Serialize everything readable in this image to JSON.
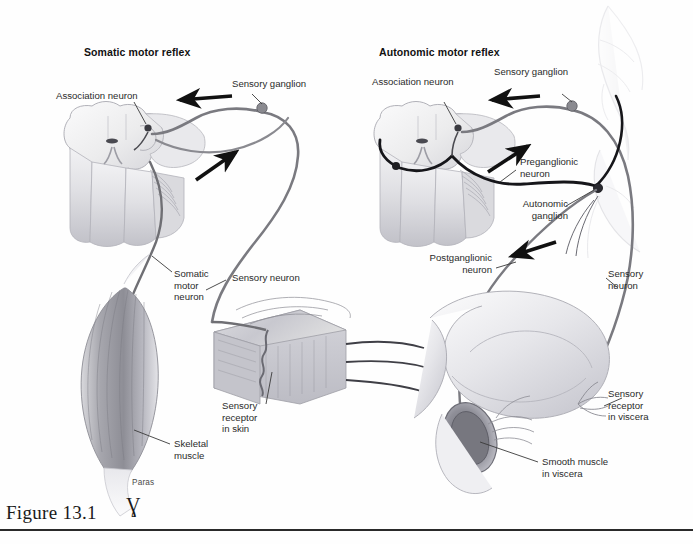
{
  "figure": {
    "caption": "Figure 13.1",
    "caption_mark": "Ɣ",
    "artist_signature": "Paras",
    "background_color": "#fefefe",
    "rule_color": "#2a2a2a"
  },
  "panels": [
    {
      "id": "somatic",
      "title": "Somatic motor reflex",
      "labels": [
        {
          "name": "association-neuron",
          "text": "Association neuron"
        },
        {
          "name": "sensory-ganglion",
          "text": "Sensory ganglion"
        },
        {
          "name": "sensory-neuron",
          "text": "Sensory neuron"
        },
        {
          "name": "somatic-motor-neuron",
          "text": "Somatic\nmotor\nneuron"
        },
        {
          "name": "sensory-receptor-in-skin",
          "text": "Sensory\nreceptor\nin skin"
        },
        {
          "name": "skeletal-muscle",
          "text": "Skeletal\nmuscle"
        }
      ]
    },
    {
      "id": "autonomic",
      "title": "Autonomic motor reflex",
      "labels": [
        {
          "name": "association-neuron",
          "text": "Association neuron"
        },
        {
          "name": "sensory-ganglion",
          "text": "Sensory ganglion"
        },
        {
          "name": "preganglionic-neuron",
          "text": "Preganglionic\nneuron"
        },
        {
          "name": "autonomic-ganglion",
          "text": "Autonomic\nganglion"
        },
        {
          "name": "postganglionic-neuron",
          "text": "Postganglionic\nneuron"
        },
        {
          "name": "sensory-neuron",
          "text": "Sensory\nneuron"
        },
        {
          "name": "sensory-receptor-in-viscera",
          "text": "Sensory\nreceptor\nin viscera"
        },
        {
          "name": "smooth-muscle-in-viscera",
          "text": "Smooth muscle\nin viscera"
        }
      ]
    }
  ],
  "colors": {
    "neuron_gray": "#6f6f74",
    "neuron_dark": "#1d1d1f",
    "arrow_black": "#111111",
    "tissue_light": "#e9e9ec",
    "tissue_mid": "#c9c9cf",
    "tissue_dark": "#9a9aa2",
    "leader_line": "#3a3a3a",
    "label_text": "#2b2b2b"
  }
}
